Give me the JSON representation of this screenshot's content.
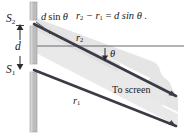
{
  "figure": {
    "kind": "double-slit path difference diagram",
    "colors": {
      "ray": "#3b3b46",
      "barrier": "#b8b8b8",
      "barrier_edge": "#8f8f8f",
      "beam_shade": "#e3e3e3",
      "axis": "#5a5a62",
      "text": "#1a1a1a",
      "background": "#ffffff"
    }
  },
  "labels": {
    "slit_top": {
      "base": "S",
      "sub": "2"
    },
    "slit_bottom": {
      "base": "S",
      "sub": "1"
    },
    "separation": "d",
    "path_difference": {
      "prefix": "d",
      "func": "sin",
      "angle": "θ"
    },
    "ray_upper": {
      "base": "r",
      "sub": "2"
    },
    "ray_lower": {
      "base": "r",
      "sub": "1"
    },
    "angle": "θ",
    "to_screen": "To screen",
    "equation": {
      "lhs_a": {
        "base": "r",
        "sub": "2"
      },
      "minus": "−",
      "lhs_b": {
        "base": "r",
        "sub": "1"
      },
      "equals": "=",
      "rhs": "d sin θ .",
      "full": "r₂ − r₁ = d sin θ ."
    }
  },
  "geometry": {
    "barrier_x": 33,
    "slit_top_y": 23,
    "slit_bottom_y": 68,
    "separation_d": 45,
    "angle_degrees": 27
  }
}
